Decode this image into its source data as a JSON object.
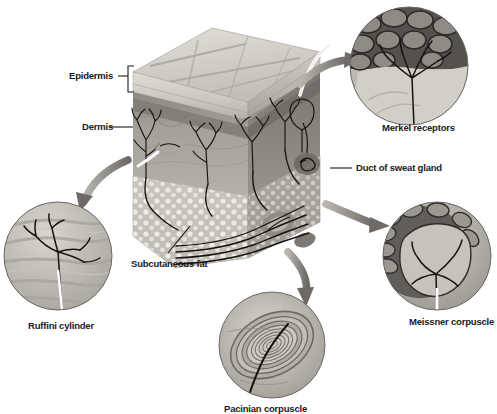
{
  "figure": {
    "type": "anatomical-diagram",
    "background_color": "#ffffff",
    "palette": {
      "ink": "#1a1a1a",
      "arrow_gray": "#8a8a8a",
      "epidermis_light": "#d8d5d0",
      "epidermis_band": "#b9b5ae",
      "dermis_mid": "#9c9890",
      "dermis_dark": "#85817a",
      "fat_light": "#cfccc6",
      "fat_dot": "#efede9",
      "inset_dark": "#6f6b65",
      "inset_light": "#c9c6c0"
    }
  },
  "labels": {
    "epidermis": "Epidermis",
    "dermis": "Dermis",
    "subcutaneous_fat": "Subcutaneous fat",
    "duct_of_sweat_gland": "Duct of sweat gland",
    "merkel_receptors": "Merkel receptors",
    "meissner_corpuscle": "Meissner corpuscle",
    "ruffini_cylinder": "Ruffini cylinder",
    "pacinian_corpuscle": "Pacinian corpuscle"
  },
  "layers": [
    {
      "name": "Epidermis",
      "label": "Epidermis",
      "marker": "bracket",
      "order": 1
    },
    {
      "name": "Dermis",
      "label": "Dermis",
      "marker": "leader-line",
      "order": 2
    },
    {
      "name": "Subcutaneous fat",
      "label": "Subcutaneous fat",
      "marker": "leader-line",
      "order": 3
    }
  ],
  "insets": [
    {
      "id": "merkel",
      "label": "Merkel receptors",
      "position": "top-right",
      "center": [
        409,
        66
      ],
      "radius": 59,
      "label_position": "below",
      "arrow_from": "skin-block-top",
      "description": "Dark cobbled epidermal cells with branching nerve fibers fanning into Merkel cells"
    },
    {
      "id": "meissner",
      "label": "Meissner corpuscle",
      "position": "bottom-right",
      "center": [
        437,
        256
      ],
      "radius": 54,
      "label_position": "below",
      "arrow_from": "skin-block-right",
      "description": "Lobulated stack of cells within a dermal papilla, nerve fiber entering from below"
    },
    {
      "id": "pacinian",
      "label": "Pacinian corpuscle",
      "position": "bottom-center",
      "center": [
        272,
        345
      ],
      "radius": 53,
      "label_position": "below",
      "label_clipped": true,
      "arrow_from": "skin-block-bottom",
      "description": "Concentric onion-like lamellae surrounding a single central nerve fiber"
    },
    {
      "id": "ruffini",
      "label": "Ruffini cylinder",
      "position": "bottom-left",
      "center": [
        58,
        256
      ],
      "radius": 54,
      "label_position": "below",
      "arrow_from": "skin-block-left",
      "description": "Branching dendritic nerve endings interwoven among collagen fiber bundles"
    }
  ],
  "callout_arrows": [
    {
      "id": "arrow-to-merkel",
      "target": "merkel",
      "direction": "up-right",
      "style": "thick-tapered-curve"
    },
    {
      "id": "arrow-to-meissner",
      "target": "meissner",
      "direction": "right-down",
      "style": "thick-tapered-curve"
    },
    {
      "id": "arrow-to-pacinian",
      "target": "pacinian",
      "direction": "down",
      "style": "thick-tapered-curve"
    },
    {
      "id": "arrow-to-ruffini",
      "target": "ruffini",
      "direction": "down-left",
      "style": "thick-tapered-curve"
    }
  ],
  "leader_lines": [
    {
      "id": "leader-epidermis",
      "label": "Epidermis",
      "style": "dash-and-bracket"
    },
    {
      "id": "leader-dermis",
      "label": "Dermis",
      "style": "straight"
    },
    {
      "id": "leader-subcutaneous-fat",
      "label": "Subcutaneous fat",
      "style": "diagonal"
    },
    {
      "id": "leader-duct-of-sweat-gland",
      "label": "Duct of sweat gland",
      "style": "straight"
    }
  ]
}
